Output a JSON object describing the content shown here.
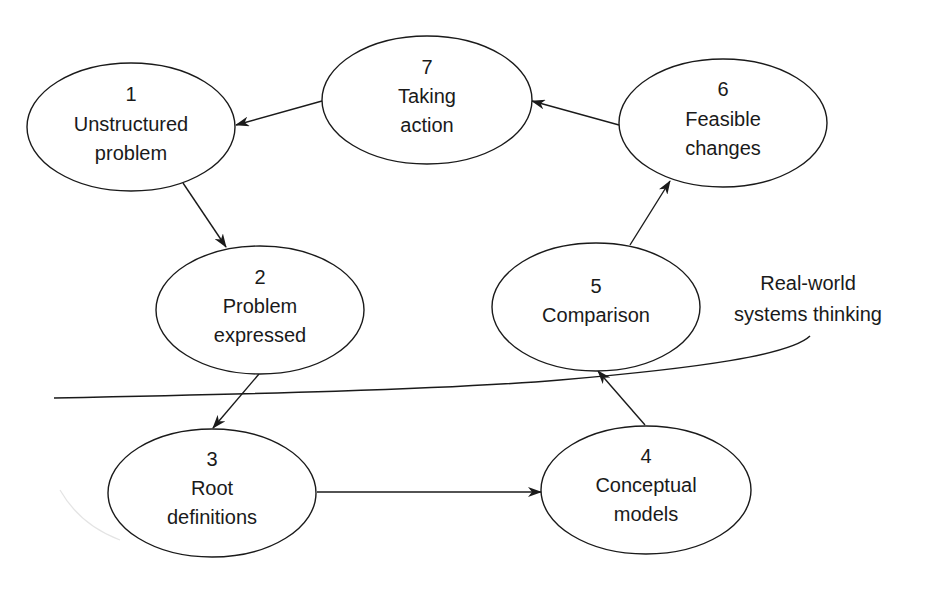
{
  "diagram": {
    "nodes": [
      {
        "id": "1",
        "number": "1",
        "line1": "Unstructured",
        "line2": "problem",
        "cx": 131,
        "cy": 127,
        "rx": 104,
        "ry": 64
      },
      {
        "id": "2",
        "number": "2",
        "line1": "Problem",
        "line2": "expressed",
        "cx": 260,
        "cy": 310,
        "rx": 104,
        "ry": 64
      },
      {
        "id": "3",
        "number": "3",
        "line1": "Root",
        "line2": "definitions",
        "cx": 212,
        "cy": 493,
        "rx": 104,
        "ry": 64
      },
      {
        "id": "4",
        "number": "4",
        "line1": "Conceptual",
        "line2": "models",
        "cx": 646,
        "cy": 490,
        "rx": 105,
        "ry": 64
      },
      {
        "id": "5",
        "number": "5",
        "line1": "Comparison",
        "line2": "",
        "cx": 596,
        "cy": 307,
        "rx": 104,
        "ry": 64
      },
      {
        "id": "6",
        "number": "6",
        "line1": "Feasible",
        "line2": "changes",
        "cx": 723,
        "cy": 123,
        "rx": 104,
        "ry": 64
      },
      {
        "id": "7",
        "number": "7",
        "line1": "Taking",
        "line2": "action",
        "cx": 427,
        "cy": 100,
        "rx": 105,
        "ry": 64
      }
    ],
    "edges": [
      {
        "from": "7",
        "to": "1"
      },
      {
        "from": "1",
        "to": "2"
      },
      {
        "from": "2",
        "to": "3"
      },
      {
        "from": "3",
        "to": "4"
      },
      {
        "from": "4",
        "to": "5"
      },
      {
        "from": "5",
        "to": "6"
      },
      {
        "from": "6",
        "to": "7"
      }
    ],
    "boundary": {
      "label_line1": "Real-world",
      "label_line2": "systems thinking"
    }
  }
}
